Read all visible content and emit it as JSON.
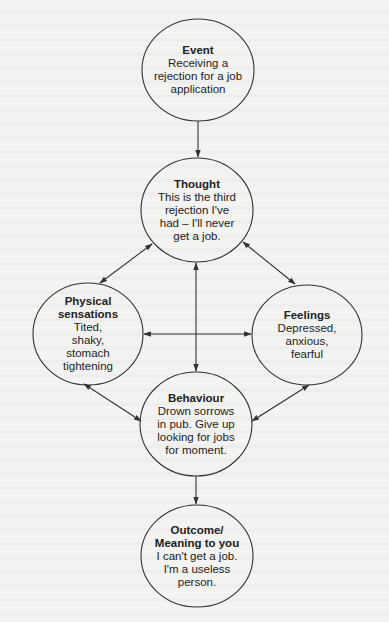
{
  "diagram": {
    "type": "cbt-cycle-flowchart",
    "colors": {
      "background": "#f3f3f1",
      "stroke": "#333333",
      "text": "#222222"
    },
    "nodes": [
      {
        "id": "event",
        "title": "Event",
        "lines": [
          "Receiving a",
          "rejection for a job",
          "application"
        ]
      },
      {
        "id": "thought",
        "title": "Thought",
        "lines": [
          "This is the third",
          "rejection I've",
          "had – I'll never",
          "get a job."
        ]
      },
      {
        "id": "physical",
        "title_lines": [
          "Physical",
          "sensations"
        ],
        "lines": [
          "Tited,",
          "shaky,",
          "stomach",
          "tightening"
        ]
      },
      {
        "id": "feelings",
        "title": "Feelings",
        "lines": [
          "Depressed,",
          "anxious,",
          "fearful"
        ]
      },
      {
        "id": "behaviour",
        "title": "Behaviour",
        "lines": [
          "Drown sorrows",
          "in pub. Give up",
          "looking for jobs",
          "for moment."
        ]
      },
      {
        "id": "outcome",
        "title_lines": [
          "Outcome/",
          "Meaning to you"
        ],
        "lines": [
          "I can't get a job.",
          "I'm a useless",
          "person."
        ]
      }
    ],
    "edges": [
      {
        "from": "event",
        "to": "thought",
        "direction": "one-way"
      },
      {
        "from": "thought",
        "to": "physical",
        "direction": "two-way"
      },
      {
        "from": "thought",
        "to": "feelings",
        "direction": "two-way"
      },
      {
        "from": "thought",
        "to": "behaviour",
        "direction": "two-way"
      },
      {
        "from": "physical",
        "to": "feelings",
        "direction": "two-way"
      },
      {
        "from": "physical",
        "to": "behaviour",
        "direction": "two-way"
      },
      {
        "from": "feelings",
        "to": "behaviour",
        "direction": "two-way"
      },
      {
        "from": "behaviour",
        "to": "outcome",
        "direction": "one-way"
      }
    ]
  }
}
